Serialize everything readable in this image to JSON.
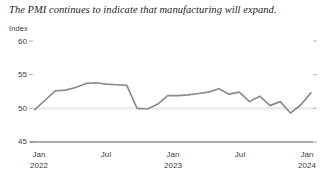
{
  "title": "The PMI continues to indicate that manufacturing will expand.",
  "axis_unit_label": "Index",
  "colors": {
    "line": "#8c8c8c",
    "axis": "#58595b",
    "text": "#3c3c3b",
    "reference_line": "#e8e8e8",
    "background": "#ffffff"
  },
  "chart_data": {
    "type": "line",
    "title": "The PMI continues to indicate that manufacturing will expand.",
    "subtitle": "",
    "xlabel": "",
    "ylabel": "Index",
    "ylim": [
      45,
      60
    ],
    "yticks": [
      45,
      50,
      55,
      60
    ],
    "ytick_labels": [
      "45",
      "50",
      "55",
      "60"
    ],
    "grid": false,
    "legend": "none",
    "reference_lines": [
      {
        "value": 50,
        "orientation": "horizontal",
        "label": ""
      }
    ],
    "xtick_positions": [
      "2022-01",
      "2022-07",
      "2023-01",
      "2023-07",
      "2024-01"
    ],
    "xtick_labels": [
      {
        "line1": "Jan",
        "line2": "2022"
      },
      {
        "line1": "Jul",
        "line2": ""
      },
      {
        "line1": "Jan",
        "line2": "2023"
      },
      {
        "line1": "Jul",
        "line2": ""
      },
      {
        "line1": "Jan",
        "line2": "2024"
      }
    ],
    "series": [
      {
        "name": "PMI",
        "color": "#8c8c8c",
        "x": [
          "2022-01",
          "2022-02",
          "2022-03",
          "2022-04",
          "2022-05",
          "2022-06",
          "2022-07",
          "2022-08",
          "2022-09",
          "2022-10",
          "2022-11",
          "2022-12",
          "2023-01",
          "2023-02",
          "2023-03",
          "2023-04",
          "2023-05",
          "2023-06",
          "2023-07",
          "2023-08",
          "2023-09",
          "2023-10",
          "2023-11",
          "2023-12",
          "2024-01",
          "2024-02",
          "2024-03",
          "2024-04"
        ],
        "values": [
          49.8,
          51.2,
          52.6,
          52.7,
          53.1,
          53.7,
          53.8,
          53.6,
          53.5,
          53.4,
          50.0,
          49.9,
          50.6,
          51.9,
          51.9,
          52.0,
          52.2,
          52.4,
          52.9,
          52.1,
          52.4,
          51.0,
          51.8,
          50.4,
          51.0,
          49.3,
          50.5,
          52.3
        ]
      }
    ],
    "series_tail_flat_value": 50.6,
    "value_range_observed": [
      49.3,
      53.8
    ],
    "frequency": "monthly"
  }
}
